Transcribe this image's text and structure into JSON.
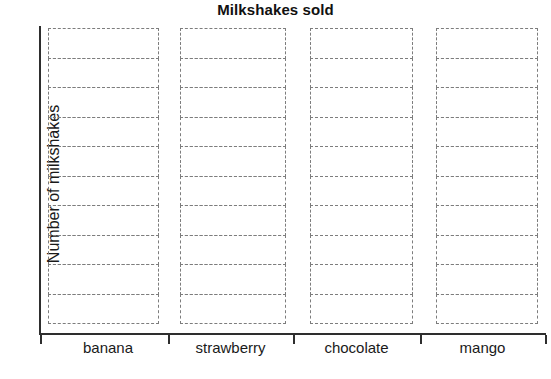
{
  "chart_data": {
    "type": "bar",
    "title": "Milkshakes sold",
    "xlabel": "",
    "ylabel": "Number of milkshakes",
    "categories": [
      "banana",
      "strawberry",
      "chocolate",
      "mango"
    ],
    "values": [
      0,
      0,
      0,
      0
    ],
    "ylim": [
      0,
      10
    ],
    "grid": true,
    "grid_rows": 10,
    "legend": "none",
    "axis_line_color": "#2e2e2e",
    "grid_line_color": "#7d7d7d",
    "grid_line_style": "dashed"
  },
  "chart": {
    "title": "Milkshakes sold",
    "y_axis_title": "Number of milkshakes",
    "columns": [
      {
        "label": "banana",
        "left": 48,
        "width": 111,
        "cells": 10
      },
      {
        "label": "strawberry",
        "left": 180,
        "width": 106,
        "cells": 10
      },
      {
        "label": "chocolate",
        "left": 310,
        "width": 103,
        "cells": 10
      },
      {
        "label": "mango",
        "left": 436,
        "width": 102,
        "cells": 10
      }
    ],
    "ticks": [
      40,
      168,
      293,
      420,
      545
    ],
    "category_label_positions": [
      {
        "left": 48,
        "width": 120
      },
      {
        "left": 168,
        "width": 125
      },
      {
        "left": 293,
        "width": 127
      },
      {
        "left": 420,
        "width": 125
      }
    ]
  }
}
